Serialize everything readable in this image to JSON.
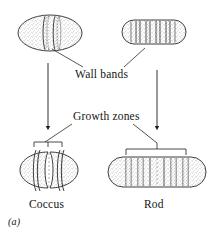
{
  "figure": {
    "panel_label": "(a)",
    "caption_labels": {
      "wall_bands": "Wall bands",
      "growth_zones": "Growth zones",
      "coccus": "Coccus",
      "rod": "Rod"
    },
    "colors": {
      "ink": "#141414",
      "outline": "#2a2a2a",
      "stipple": "#6b6b6b",
      "background": "#ffffff"
    },
    "diagram": {
      "type": "biological-schematic",
      "subject": "bacterial cell wall growth zones",
      "cells": [
        {
          "name": "coccus-parent",
          "shape": "ellipse",
          "stage": "parent",
          "wall_band_count": 2,
          "position": "top-left"
        },
        {
          "name": "rod-parent",
          "shape": "rod",
          "stage": "parent",
          "wall_band_count": 5,
          "position": "top-right"
        },
        {
          "name": "coccus-daughter",
          "shape": "ellipse-constricted",
          "stage": "growing",
          "wall_band_count": 2,
          "growth_zone_count": 1,
          "position": "bottom-left"
        },
        {
          "name": "rod-daughter",
          "shape": "rod-elongated",
          "stage": "growing",
          "wall_band_count": 7,
          "growth_zone_count": 5,
          "position": "bottom-right"
        }
      ],
      "arrows": [
        {
          "name": "coccus-growth-arrow",
          "from": "coccus-parent",
          "to": "coccus-daughter",
          "direction": "down"
        },
        {
          "name": "rod-growth-arrow",
          "from": "rod-parent",
          "to": "rod-daughter",
          "direction": "down"
        }
      ],
      "leaders": [
        {
          "name": "wall-bands-leader-left",
          "label": "Wall bands",
          "target": "coccus-parent"
        },
        {
          "name": "wall-bands-leader-right",
          "label": "Wall bands",
          "target": "rod-parent"
        },
        {
          "name": "growth-zones-leader-left",
          "label": "Growth zones",
          "target": "coccus-daughter"
        },
        {
          "name": "growth-zones-leader-right",
          "label": "Growth zones",
          "target": "rod-daughter"
        }
      ],
      "brackets": [
        {
          "name": "coccus-growth-bracket",
          "target": "coccus-daughter"
        },
        {
          "name": "rod-growth-bracket",
          "target": "rod-daughter"
        }
      ]
    }
  }
}
